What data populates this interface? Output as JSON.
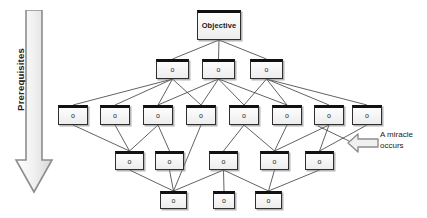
{
  "diagram": {
    "colors": {
      "node_fill": "#ededed",
      "node_border": "#2f2f2f",
      "node_header": "#111111",
      "edge": "#3a3a3a",
      "arrow_fill": "#ececec",
      "arrow_border": "#8a8a8a",
      "text": "#1a1a1a",
      "background": "#ffffff"
    },
    "axis_arrow": {
      "label": "Prerequisites",
      "direction": "down"
    },
    "annotation": {
      "icon": "left-block-arrow-icon",
      "line1": "A miracle",
      "line2": "occurs"
    },
    "rows": [
      {
        "id": "row-objective",
        "y": 10,
        "height": 30,
        "nodes": [
          {
            "id": "n0",
            "label": "Objective",
            "x": 197,
            "width": 44,
            "size": "objective"
          }
        ]
      },
      {
        "id": "row-2",
        "y": 59,
        "height": 20,
        "nodes": [
          {
            "id": "n1",
            "label": "o",
            "x": 156,
            "width": 33,
            "size": "small"
          },
          {
            "id": "n2",
            "label": "o",
            "x": 202,
            "width": 33,
            "size": "small"
          },
          {
            "id": "n3",
            "label": "o",
            "x": 250,
            "width": 33,
            "size": "small"
          }
        ]
      },
      {
        "id": "row-3",
        "y": 105,
        "height": 20,
        "nodes": [
          {
            "id": "n4",
            "label": "o",
            "x": 58,
            "width": 30,
            "size": "small"
          },
          {
            "id": "n5",
            "label": "o",
            "x": 100,
            "width": 30,
            "size": "small"
          },
          {
            "id": "n6",
            "label": "o",
            "x": 143,
            "width": 30,
            "size": "small"
          },
          {
            "id": "n7",
            "label": "o",
            "x": 186,
            "width": 30,
            "size": "small"
          },
          {
            "id": "n8",
            "label": "o",
            "x": 229,
            "width": 30,
            "size": "small"
          },
          {
            "id": "n9",
            "label": "o",
            "x": 272,
            "width": 30,
            "size": "small"
          },
          {
            "id": "n10",
            "label": "o",
            "x": 314,
            "width": 30,
            "size": "small"
          },
          {
            "id": "n11",
            "label": "o",
            "x": 352,
            "width": 30,
            "size": "small"
          }
        ]
      },
      {
        "id": "row-4",
        "y": 151,
        "height": 19,
        "nodes": [
          {
            "id": "n12",
            "label": "o",
            "x": 115,
            "width": 29,
            "size": "small"
          },
          {
            "id": "n13",
            "label": "o",
            "x": 155,
            "width": 29,
            "size": "small"
          },
          {
            "id": "n14",
            "label": "o",
            "x": 209,
            "width": 29,
            "size": "small"
          },
          {
            "id": "n15",
            "label": "o",
            "x": 260,
            "width": 29,
            "size": "small"
          },
          {
            "id": "n16",
            "label": "o",
            "x": 305,
            "width": 29,
            "size": "small"
          }
        ]
      },
      {
        "id": "row-5",
        "y": 191,
        "height": 18,
        "nodes": [
          {
            "id": "n17",
            "label": "o",
            "x": 160,
            "width": 27,
            "size": "small"
          },
          {
            "id": "n18",
            "label": "o",
            "x": 213,
            "width": 22,
            "size": "small"
          },
          {
            "id": "n19",
            "label": "o",
            "x": 255,
            "width": 27,
            "size": "small"
          }
        ]
      }
    ],
    "edges": [
      [
        "n0",
        "n1"
      ],
      [
        "n0",
        "n2"
      ],
      [
        "n0",
        "n3"
      ],
      [
        "n1",
        "n4"
      ],
      [
        "n1",
        "n5"
      ],
      [
        "n1",
        "n6"
      ],
      [
        "n1",
        "n7"
      ],
      [
        "n2",
        "n6"
      ],
      [
        "n2",
        "n7"
      ],
      [
        "n2",
        "n8"
      ],
      [
        "n2",
        "n9"
      ],
      [
        "n3",
        "n8"
      ],
      [
        "n3",
        "n9"
      ],
      [
        "n3",
        "n10"
      ],
      [
        "n3",
        "n11"
      ],
      [
        "n4",
        "n12"
      ],
      [
        "n5",
        "n12"
      ],
      [
        "n6",
        "n12"
      ],
      [
        "n6",
        "n13"
      ],
      [
        "n7",
        "n17"
      ],
      [
        "n8",
        "n14"
      ],
      [
        "n8",
        "n15"
      ],
      [
        "n9",
        "n15"
      ],
      [
        "n10",
        "n15"
      ],
      [
        "n10",
        "n16"
      ],
      [
        "n11",
        "n16"
      ],
      [
        "n12",
        "n17"
      ],
      [
        "n13",
        "n17"
      ],
      [
        "n14",
        "n17"
      ],
      [
        "n14",
        "n18"
      ],
      [
        "n14",
        "n19"
      ],
      [
        "n15",
        "n19"
      ],
      [
        "n16",
        "n19"
      ]
    ]
  }
}
